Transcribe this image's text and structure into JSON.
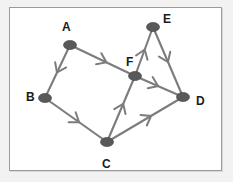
{
  "figure": {
    "background_color": "#f2f2f2",
    "panel_color": "#ffffff",
    "border_color": "#9a9a9a",
    "edge_color": "#7c7c7c",
    "node_color": "#59595b",
    "label_color": "#1b1b1b"
  },
  "nodes": [
    {
      "id": "A",
      "label": "A",
      "x": 70,
      "y": 45,
      "rx": 6.5,
      "ry": 4.6,
      "label_x": 62,
      "label_y": 21
    },
    {
      "id": "B",
      "label": "B",
      "x": 45,
      "y": 98,
      "rx": 6.5,
      "ry": 4.6,
      "label_x": 26,
      "label_y": 91
    },
    {
      "id": "C",
      "label": "C",
      "x": 107,
      "y": 142,
      "rx": 6.5,
      "ry": 4.6,
      "label_x": 102,
      "label_y": 158
    },
    {
      "id": "D",
      "label": "D",
      "x": 183,
      "y": 97,
      "rx": 6.5,
      "ry": 4.6,
      "label_x": 196,
      "label_y": 95
    },
    {
      "id": "E",
      "label": "E",
      "x": 153,
      "y": 27,
      "rx": 6.5,
      "ry": 4.6,
      "label_x": 163,
      "label_y": 13
    },
    {
      "id": "F",
      "label": "F",
      "x": 135,
      "y": 76,
      "rx": 6.5,
      "ry": 4.6,
      "label_x": 126,
      "label_y": 56
    }
  ],
  "edges": [
    {
      "id": "A-B",
      "from": "A",
      "to": "B",
      "directed": true,
      "arrow_t": 0.52,
      "description": "A to B, arrow pointing down-left toward B"
    },
    {
      "id": "A-F",
      "from": "A",
      "to": "F",
      "directed": true,
      "arrow_t": 0.56,
      "description": "A to F, arrow pointing right toward F"
    },
    {
      "id": "B-C",
      "from": "B",
      "to": "C",
      "directed": true,
      "arrow_t": 0.55,
      "description": "B to C, arrow pointing down-right toward C"
    },
    {
      "id": "C-F",
      "from": "C",
      "to": "F",
      "directed": true,
      "arrow_t": 0.58,
      "description": "C to F, arrow pointing up toward F"
    },
    {
      "id": "C-D",
      "from": "C",
      "to": "D",
      "directed": true,
      "arrow_t": 0.58,
      "description": "C to D, arrow pointing up-right toward D"
    },
    {
      "id": "F-D",
      "from": "F",
      "to": "D",
      "directed": true,
      "arrow_t": 0.48,
      "description": "F to D, arrow pointing right toward D"
    },
    {
      "id": "F-E",
      "from": "F",
      "to": "E",
      "directed": true,
      "arrow_t": 0.54,
      "description": "F to E, arrow pointing up toward E"
    },
    {
      "id": "E-D",
      "from": "E",
      "to": "D",
      "directed": true,
      "arrow_t": 0.5,
      "description": "E to D, arrow pointing down toward D"
    }
  ],
  "legend": {
    "node_count": 6,
    "edge_count": 8
  }
}
